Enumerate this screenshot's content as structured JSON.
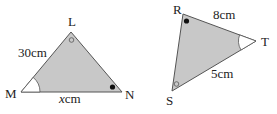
{
  "colors": {
    "fill": "#c8c8c8",
    "stroke": "#555555",
    "angle_fill": "#ffffff",
    "text": "#222222"
  },
  "triangle_lmn": {
    "vertices": {
      "L": "L",
      "M": "M",
      "N": "N"
    },
    "side_lm": "30cm",
    "side_mn_var": "x",
    "side_mn_unit": "cm",
    "angle_markers": {
      "M": "arc",
      "L": "hollow-circle",
      "N": "filled-dot"
    }
  },
  "triangle_rst": {
    "vertices": {
      "R": "R",
      "S": "S",
      "T": "T"
    },
    "side_rt": "8cm",
    "side_st": "5cm",
    "angle_markers": {
      "R": "filled-dot",
      "S": "hollow-circle",
      "T": "arc"
    }
  }
}
